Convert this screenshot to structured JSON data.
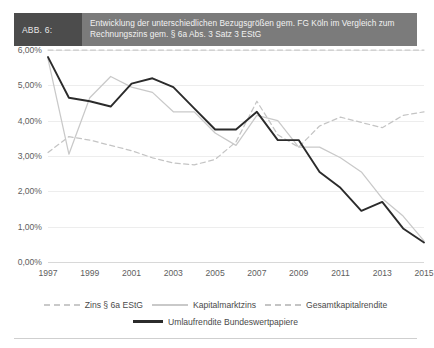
{
  "caption": {
    "tag": "ABB. 6:",
    "title": "Entwicklung der unterschiedlichen Bezugsgrößen gem. FG Köln im Vergleich zum Rechnungszins gem. § 6a Abs. 3 Satz 3 EStG"
  },
  "colors": {
    "tag_bg": "#4c4c4c",
    "title_bg": "#7b7b7b",
    "zins": "#c9c9c9",
    "kapitalmarktzins": "#c9c9c9",
    "gesamtkapitalrendite": "#c4c4c4",
    "umlaufrendite": "#2b2b2b",
    "grid": "#ededed",
    "axis_text": "#5e5e5e"
  },
  "chart_data": {
    "type": "line",
    "title": "Entwicklung der unterschiedlichen Bezugsgrößen gem. FG Köln im Vergleich zum Rechnungszins gem. § 6a Abs. 3 Satz 3 EStG",
    "xlabel": "",
    "ylabel": "",
    "ylim": [
      0,
      6
    ],
    "ytick_labels": [
      "6,00%",
      "5,00%",
      "4,00%",
      "3,00%",
      "2,00%",
      "1,00%",
      "0,00%"
    ],
    "ytick_values": [
      6,
      5,
      4,
      3,
      2,
      1,
      0
    ],
    "grid": true,
    "legend_position": "bottom",
    "x": [
      1997,
      1998,
      1999,
      2000,
      2001,
      2002,
      2003,
      2004,
      2005,
      2006,
      2007,
      2008,
      2009,
      2010,
      2011,
      2012,
      2013,
      2014,
      2015
    ],
    "xtick_labels": [
      "1997",
      "1999",
      "2001",
      "2003",
      "2005",
      "2007",
      "2009",
      "2011",
      "2013",
      "2015"
    ],
    "xtick_values": [
      1997,
      1999,
      2001,
      2003,
      2005,
      2007,
      2009,
      2011,
      2013,
      2015
    ],
    "series": [
      {
        "name": "Zins § 6a EStG",
        "style": "dashed",
        "color": "#c9c9c9",
        "values": [
          6.0,
          6.0,
          6.0,
          6.0,
          6.0,
          6.0,
          6.0,
          6.0,
          6.0,
          6.0,
          6.0,
          6.0,
          6.0,
          6.0,
          6.0,
          6.0,
          6.0,
          6.0,
          6.0
        ]
      },
      {
        "name": "Kapitalmarktzins",
        "style": "solid",
        "color": "#c9c9c9",
        "values": [
          5.75,
          3.05,
          4.65,
          5.25,
          4.95,
          4.8,
          4.25,
          4.25,
          3.65,
          3.3,
          4.15,
          4.0,
          3.25,
          3.25,
          2.95,
          2.55,
          1.8,
          1.3,
          0.6
        ]
      },
      {
        "name": "Gesamtkapitalrendite",
        "style": "dashed",
        "color": "#c4c4c4",
        "values": [
          3.1,
          3.55,
          3.45,
          3.3,
          3.15,
          2.95,
          2.8,
          2.75,
          2.9,
          3.4,
          4.55,
          3.6,
          3.25,
          3.85,
          4.1,
          3.95,
          3.8,
          4.15,
          4.25
        ]
      },
      {
        "name": "Umlaufrendite Bundeswertpapiere",
        "style": "solid",
        "color": "#2b2b2b",
        "values": [
          5.8,
          4.65,
          4.55,
          4.4,
          5.05,
          5.2,
          4.95,
          4.35,
          3.75,
          3.75,
          4.25,
          3.45,
          3.45,
          2.55,
          2.1,
          1.45,
          1.7,
          0.95,
          0.55
        ]
      }
    ]
  },
  "legend": {
    "items": [
      {
        "label": "Zins § 6a EStG",
        "swatch": "dashed-light"
      },
      {
        "label": "Kapitalmarktzins",
        "swatch": "solid-light"
      },
      {
        "label": "Gesamtkapitalrendite",
        "swatch": "dashed-mid"
      },
      {
        "label": "Umlaufrendite Bundeswertpapiere",
        "swatch": "solid-black"
      }
    ]
  }
}
